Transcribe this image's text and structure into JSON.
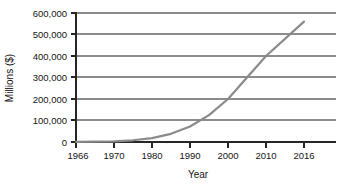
{
  "chart_data": {
    "type": "line",
    "title": "",
    "xlabel": "Year",
    "ylabel": "Millions ($)",
    "xlim": [
      1966,
      2020
    ],
    "ylim": [
      0,
      600000
    ],
    "grid": "horizontal",
    "legend": "none",
    "line_color": "#8a8a8a",
    "x_tick_labels": [
      "1966",
      "1970",
      "1980",
      "1990",
      "2000",
      "2010",
      "2016"
    ],
    "x_ticks": [
      1966,
      1970,
      1980,
      1990,
      2000,
      2010,
      2016
    ],
    "y_tick_labels": [
      "0",
      "100,000",
      "200,000",
      "300,000",
      "400,000",
      "500,000",
      "600,000"
    ],
    "y_ticks": [
      0,
      100000,
      200000,
      300000,
      400000,
      500000,
      600000
    ],
    "x": [
      1966,
      1970,
      1975,
      1980,
      1985,
      1990,
      1995,
      2000,
      2005,
      2010,
      2016
    ],
    "values": [
      1000,
      3000,
      8000,
      18000,
      38000,
      72000,
      125000,
      200000,
      300000,
      400000,
      560000
    ],
    "series": [
      {
        "name": "",
        "x": [
          1966,
          1970,
          1975,
          1980,
          1985,
          1990,
          1995,
          2000,
          2005,
          2010,
          2016
        ],
        "values": [
          1000,
          3000,
          8000,
          18000,
          38000,
          72000,
          125000,
          200000,
          300000,
          400000,
          560000
        ]
      }
    ]
  },
  "axes": {
    "y_title": "Millions ($)",
    "x_title": "Year",
    "y_labels": {
      "t0": "600,000",
      "t1": "500,000",
      "t2": "400,000",
      "t3": "300,000",
      "t4": "200,000",
      "t5": "100,000",
      "t6": "0"
    },
    "x_labels": {
      "t0": "1966",
      "t1": "1970",
      "t2": "1980",
      "t3": "1990",
      "t4": "2000",
      "t5": "2010",
      "t6": "2016"
    }
  }
}
